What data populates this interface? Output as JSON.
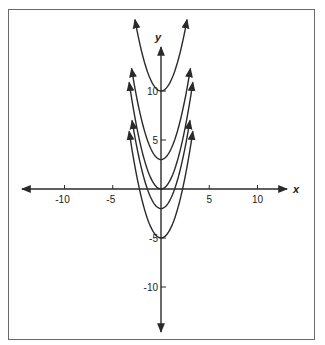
{
  "chart_data": {
    "type": "line",
    "title": "",
    "xlabel": "x",
    "ylabel": "y",
    "xlim": [
      -14,
      14
    ],
    "ylim": [
      -14,
      17
    ],
    "grid": false,
    "legend": null,
    "x_ticks": [
      -10,
      -5,
      5,
      10
    ],
    "x_tick_labels": [
      "-10",
      "-5",
      "5",
      "10"
    ],
    "y_ticks": [
      10,
      5,
      -5,
      -10
    ],
    "y_tick_labels": [
      "10",
      "5",
      "-5",
      "-10"
    ],
    "series": [
      {
        "name": "y = x^2 + 10",
        "vertex": [
          0,
          10
        ],
        "x_range": [
          -2.7,
          2.7
        ]
      },
      {
        "name": "y = x^2 + 3",
        "vertex": [
          0,
          3
        ],
        "x_range": [
          -3.05,
          3.05
        ]
      },
      {
        "name": "y = x^2",
        "vertex": [
          0,
          0
        ],
        "x_range": [
          -3.3,
          3.3
        ]
      },
      {
        "name": "y = x^2 - 2",
        "vertex": [
          0,
          -2
        ],
        "x_range": [
          -3.0,
          3.0
        ]
      },
      {
        "name": "y = x^2 - 5",
        "vertex": [
          0,
          -5
        ],
        "x_range": [
          -3.3,
          3.3
        ]
      }
    ],
    "annotations": "Family of parabolas y = x^2 + k shifted vertically, each with arrowheads at both ends"
  },
  "axes": {
    "x_label": "x",
    "y_label": "y"
  },
  "colors": {
    "line": "#2a2a2a",
    "frame": "#6a6a6a",
    "background": "#ffffff"
  }
}
